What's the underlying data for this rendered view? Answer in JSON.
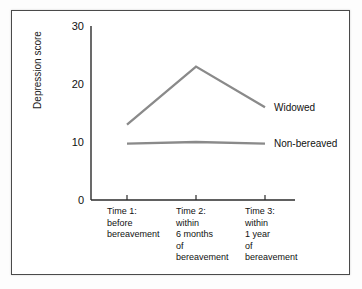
{
  "chart_data": {
    "type": "line",
    "title": "",
    "subtitle": "",
    "xlabel": "",
    "ylabel": "Depression score",
    "ylim": [
      0,
      30
    ],
    "yticks": [
      0,
      10,
      20,
      30
    ],
    "ytick_labels": [
      "0",
      "10",
      "20",
      "30"
    ],
    "grid": false,
    "legend_position": "right-inline",
    "categories": [
      "Time 1:\nbefore\nbereavement",
      "Time 2:\nwithin\n6 months\nof\nbereavement",
      "Time 3:\nwithin\n1 year\nof\nbereavement"
    ],
    "category_lines": [
      [
        "Time 1:",
        "before",
        "bereavement"
      ],
      [
        "Time 2:",
        "within",
        "6 months",
        "of",
        "bereavement"
      ],
      [
        "Time 3:",
        "within",
        "1 year",
        "of",
        "bereavement"
      ]
    ],
    "series": [
      {
        "name": "Widowed",
        "values": [
          13,
          23,
          16
        ],
        "color": "#8a8a8a"
      },
      {
        "name": "Non-bereaved",
        "values": [
          9.7,
          10,
          9.7
        ],
        "color": "#8a8a8a"
      }
    ]
  },
  "axes": {
    "y_axis_label": "Depression score",
    "y_tick_0": "0",
    "y_tick_10": "10",
    "y_tick_20": "20",
    "y_tick_30": "30"
  },
  "series_labels": {
    "widowed": "Widowed",
    "non_bereaved": "Non-bereaved"
  },
  "x_labels": {
    "time1": "Time 1:\nbefore\nbereavement",
    "time2": "Time 2:\nwithin\n6 months\nof\nbereavement",
    "time3": "Time 3:\nwithin\n1 year\nof\nbereavement"
  },
  "colors": {
    "line": "#8a8a8a",
    "axis": "#2b2b2b",
    "text": "#111111",
    "frame": "#4a4a4a",
    "background": "#ffffff"
  }
}
